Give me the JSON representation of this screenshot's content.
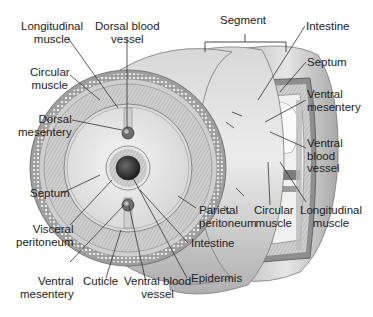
{
  "diagram": {
    "colors": {
      "background": "#ffffff",
      "text": "#222222",
      "leader_line": "#333333",
      "body_light": "#e4e4e4",
      "body_mid": "#c4c4c4",
      "body_dark": "#8a8a8a",
      "intestine_lumen": "#3a3a3a"
    },
    "labels": {
      "longitudinal_muscle_left": "Longitudinal\nmuscle",
      "dorsal_blood_vessel": "Dorsal blood\nvessel",
      "segment": "Segment",
      "intestine_top": "Intestine",
      "circular_muscle_left": "Circular\nmuscle",
      "septum_right": "Septum",
      "dorsal_mesentery": "Dorsal\nmesentery",
      "ventral_mesentery_right": "Ventral\nmesentery",
      "ventral_blood_vessel_right": "Ventral\nblood\nvessel",
      "septum_left": "Septum",
      "parietal_peritoneum": "Parietal\nperitoneum",
      "circular_muscle_bottom": "Circular\nmuscle",
      "longitudinal_muscle_bottom": "Longitudinal\nmuscle",
      "visceral_peritoneum": "Visceral\nperitoneum",
      "intestine_bottom": "Intestine",
      "ventral_mesentery_bottom": "Ventral\nmesentery",
      "cuticle": "Cuticle",
      "ventral_blood_vessel_bottom": "Ventral blood\nvessel",
      "epidermis": "Epidermis"
    }
  }
}
